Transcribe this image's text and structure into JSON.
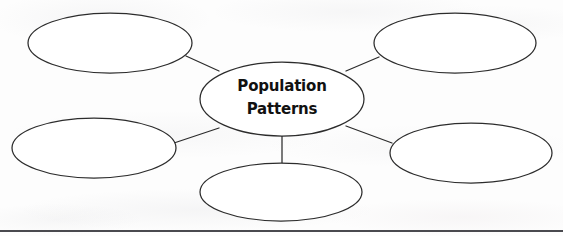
{
  "page": {
    "background_color": "#fdfdfd",
    "width": 563,
    "height": 236
  },
  "diagram": {
    "type": "web-cluster-graphic-organizer",
    "stroke_color": "#2c2c2c",
    "fill_color": "#ffffff",
    "center": {
      "label_line1": "Population",
      "label_line2": "Patterns",
      "text_color": "#111111",
      "cx": 282,
      "cy": 99,
      "rx": 82,
      "ry": 37
    },
    "satellites": [
      {
        "name": "top-left",
        "label": "",
        "cx": 110,
        "cy": 43,
        "rx": 82,
        "ry": 30
      },
      {
        "name": "top-right",
        "label": "",
        "cx": 455,
        "cy": 43,
        "rx": 81,
        "ry": 30
      },
      {
        "name": "bottom-left",
        "label": "",
        "cx": 94,
        "cy": 148,
        "rx": 82,
        "ry": 30
      },
      {
        "name": "bottom-right",
        "label": "",
        "cx": 471,
        "cy": 153,
        "rx": 81,
        "ry": 30
      },
      {
        "name": "bottom-center",
        "label": "",
        "cx": 281,
        "cy": 192,
        "rx": 81,
        "ry": 29
      }
    ],
    "connectors": [
      {
        "name": "center-to-top-left",
        "x1": 219,
        "y1": 71,
        "x2": 186,
        "y2": 56
      },
      {
        "name": "center-to-top-right",
        "x1": 346,
        "y1": 71,
        "x2": 379,
        "y2": 57
      },
      {
        "name": "center-to-bottom-left",
        "x1": 219,
        "y1": 128,
        "x2": 174,
        "y2": 143
      },
      {
        "name": "center-to-bottom-right",
        "x1": 346,
        "y1": 126,
        "x2": 392,
        "y2": 143
      },
      {
        "name": "center-to-bottom-center",
        "x1": 282,
        "y1": 136,
        "x2": 282,
        "y2": 163
      }
    ]
  },
  "footer": {
    "rule_color": "#4a4a4f"
  }
}
